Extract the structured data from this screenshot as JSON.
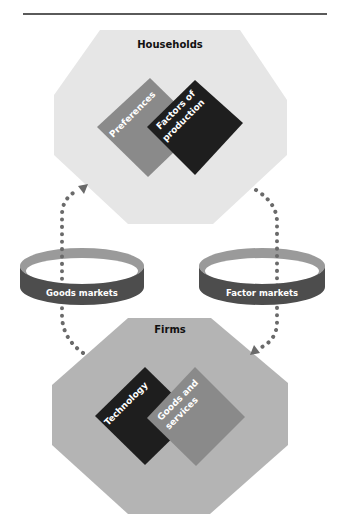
{
  "header": {
    "title_cut": "•••••••••"
  },
  "households": {
    "title": "Households",
    "diamonds": [
      {
        "label": "Preferences",
        "color": "#8a8a8a"
      },
      {
        "label_line1": "Factors of",
        "label_line2": "production",
        "color": "#1e1e1e"
      }
    ],
    "bg_color": "#e6e6e6"
  },
  "firms": {
    "title": "Firms",
    "diamonds": [
      {
        "label": "Technology",
        "color": "#1e1e1e"
      },
      {
        "label_line1": "Goods and",
        "label_line2": "services",
        "color": "#8a8a8a"
      }
    ],
    "bg_color": "#b4b4b4"
  },
  "markets": {
    "goods": {
      "label": "Goods markets"
    },
    "factor": {
      "label": "Factor markets"
    }
  },
  "flow_color": "#6a6a6a"
}
